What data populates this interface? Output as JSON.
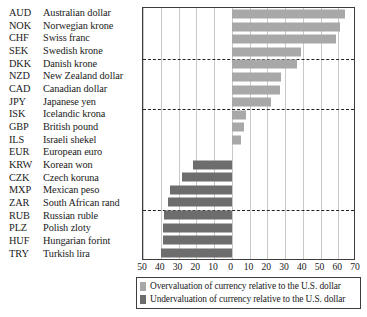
{
  "chart_data": {
    "type": "bar",
    "orientation": "horizontal",
    "title": "",
    "xlabel": "",
    "ylabel": "",
    "xlim": [
      -50,
      70
    ],
    "xticks": [
      -50,
      -40,
      -30,
      -20,
      -10,
      0,
      10,
      20,
      30,
      40,
      50,
      60,
      70
    ],
    "xtick_labels": [
      "50",
      "40",
      "30",
      "20",
      "10",
      "0",
      "10",
      "20",
      "30",
      "40",
      "50",
      "60",
      "70"
    ],
    "grid": true,
    "legend_position": "bottom",
    "categories": [
      "AUD",
      "NOK",
      "CHF",
      "SEK",
      "DKK",
      "NZD",
      "CAD",
      "JPY",
      "ISK",
      "GBP",
      "ILS",
      "EUR",
      "KRW",
      "CZK",
      "MXP",
      "ZAR",
      "RUB",
      "PLZ",
      "HUF",
      "TRY"
    ],
    "category_names": [
      "Australian dollar",
      "Norwegian krone",
      "Swiss franc",
      "Swedish krone",
      "Danish krone",
      "New Zealand dollar",
      "Canadian dollar",
      "Japanese yen",
      "Icelandic krona",
      "British pound",
      "Israeli shekel",
      "European euro",
      "Korean won",
      "Czech koruna",
      "Mexican peso",
      "South African rand",
      "Russian ruble",
      "Polish zloty",
      "Hungarian forint",
      "Turkish lira"
    ],
    "values": [
      64,
      61,
      59,
      39,
      37,
      28,
      27,
      22,
      8,
      7,
      5,
      0,
      -22,
      -28,
      -35,
      -36,
      -38,
      -39,
      -39,
      -40
    ],
    "separators_after": [
      "SEK",
      "JPY",
      "ZAR"
    ],
    "legend": [
      {
        "label": "Overvaluation of currency relative to the U.S. dollar",
        "color": "#a8a8a8",
        "key": "over"
      },
      {
        "label": "Undervaluation of currency relative to the U.S. dollar",
        "color": "#6d6d6d",
        "key": "under"
      }
    ]
  },
  "rows": [
    {
      "code": "AUD",
      "name": "Australian dollar",
      "value": 64,
      "sign": "over"
    },
    {
      "code": "NOK",
      "name": "Norwegian krone",
      "value": 61,
      "sign": "over"
    },
    {
      "code": "CHF",
      "name": "Swiss franc",
      "value": 59,
      "sign": "over"
    },
    {
      "code": "SEK",
      "name": "Swedish krone",
      "value": 39,
      "sign": "over"
    },
    {
      "code": "DKK",
      "name": "Danish krone",
      "value": 37,
      "sign": "over"
    },
    {
      "code": "NZD",
      "name": "New Zealand dollar",
      "value": 28,
      "sign": "over"
    },
    {
      "code": "CAD",
      "name": "Canadian dollar",
      "value": 27,
      "sign": "over"
    },
    {
      "code": "JPY",
      "name": "Japanese yen",
      "value": 22,
      "sign": "over"
    },
    {
      "code": "ISK",
      "name": "Icelandic krona",
      "value": 8,
      "sign": "over"
    },
    {
      "code": "GBP",
      "name": "British pound",
      "value": 7,
      "sign": "over"
    },
    {
      "code": "ILS",
      "name": "Israeli shekel",
      "value": 5,
      "sign": "over"
    },
    {
      "code": "EUR",
      "name": "European euro",
      "value": 0,
      "sign": "over"
    },
    {
      "code": "KRW",
      "name": "Korean won",
      "value": -22,
      "sign": "under"
    },
    {
      "code": "CZK",
      "name": "Czech koruna",
      "value": -28,
      "sign": "under"
    },
    {
      "code": "MXP",
      "name": "Mexican peso",
      "value": -35,
      "sign": "under"
    },
    {
      "code": "ZAR",
      "name": "South African rand",
      "value": -36,
      "sign": "under"
    },
    {
      "code": "RUB",
      "name": "Russian ruble",
      "value": -38,
      "sign": "under"
    },
    {
      "code": "PLZ",
      "name": "Polish zloty",
      "value": -39,
      "sign": "under"
    },
    {
      "code": "HUF",
      "name": "Hungarian forint",
      "value": -39,
      "sign": "under"
    },
    {
      "code": "TRY",
      "name": "Turkish lira",
      "value": -40,
      "sign": "under"
    }
  ],
  "colors": {
    "over": "#a8a8a8",
    "under": "#6d6d6d",
    "frame": "#3d3d3d",
    "grid": "#c9c9c9",
    "separator": "#222222"
  }
}
